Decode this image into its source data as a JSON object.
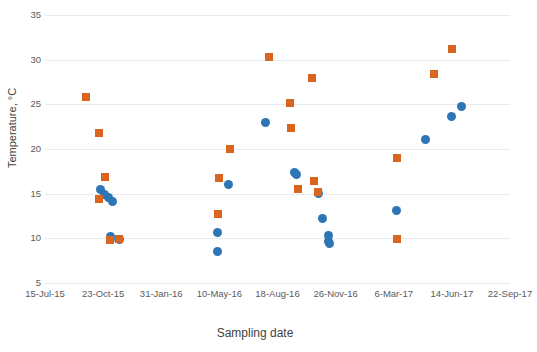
{
  "chart_data": {
    "type": "scatter",
    "title": "",
    "xlabel": "Sampling date",
    "ylabel": "Temperature, °C",
    "grid": true,
    "legend": "none",
    "ylim": [
      5,
      35
    ],
    "yticks": [
      5,
      10,
      15,
      20,
      25,
      30,
      35
    ],
    "xlim": [
      "15-Jul-15",
      "22-Sep-17"
    ],
    "xticks": [
      "15-Jul-15",
      "23-Oct-15",
      "31-Jan-16",
      "10-May-16",
      "18-Aug-16",
      "26-Nov-16",
      "6-Mar-17",
      "14-Jun-17",
      "22-Sep-17"
    ],
    "xtick_days": [
      0,
      100,
      200,
      300,
      400,
      500,
      600,
      700,
      800
    ],
    "colors": {
      "series_1": "#2e75b6",
      "series_2": "#d9661f",
      "grid": "#ebebeb",
      "tick_text": "#5a5a5a",
      "axis_title": "#3f3f3f",
      "background": "#ffffff"
    },
    "series": [
      {
        "name": "series_1",
        "marker": "circle",
        "color": "#2e75b6",
        "points": [
          {
            "x_days": 95,
            "y": 15.5
          },
          {
            "x_days": 102,
            "y": 14.9
          },
          {
            "x_days": 109,
            "y": 14.6
          },
          {
            "x_days": 116,
            "y": 14.1
          },
          {
            "x_days": 113,
            "y": 10.2
          },
          {
            "x_days": 113,
            "y": 9.9
          },
          {
            "x_days": 128,
            "y": 9.9
          },
          {
            "x_days": 297,
            "y": 8.5
          },
          {
            "x_days": 297,
            "y": 10.7
          },
          {
            "x_days": 315,
            "y": 16.0
          },
          {
            "x_days": 380,
            "y": 23.0
          },
          {
            "x_days": 430,
            "y": 17.4
          },
          {
            "x_days": 433,
            "y": 17.1
          },
          {
            "x_days": 470,
            "y": 15.0
          },
          {
            "x_days": 478,
            "y": 12.2
          },
          {
            "x_days": 487,
            "y": 10.3
          },
          {
            "x_days": 487,
            "y": 9.6
          },
          {
            "x_days": 490,
            "y": 9.4
          },
          {
            "x_days": 605,
            "y": 13.1
          },
          {
            "x_days": 655,
            "y": 21.1
          },
          {
            "x_days": 700,
            "y": 23.6
          },
          {
            "x_days": 717,
            "y": 24.8
          }
        ]
      },
      {
        "name": "series_2",
        "marker": "square",
        "color": "#d9661f",
        "points": [
          {
            "x_days": 70,
            "y": 25.8
          },
          {
            "x_days": 93,
            "y": 21.8
          },
          {
            "x_days": 93,
            "y": 14.4
          },
          {
            "x_days": 104,
            "y": 16.9
          },
          {
            "x_days": 112,
            "y": 9.8
          },
          {
            "x_days": 128,
            "y": 9.9
          },
          {
            "x_days": 297,
            "y": 12.7
          },
          {
            "x_days": 300,
            "y": 16.7
          },
          {
            "x_days": 318,
            "y": 20.0
          },
          {
            "x_days": 385,
            "y": 30.3
          },
          {
            "x_days": 422,
            "y": 25.1
          },
          {
            "x_days": 424,
            "y": 22.3
          },
          {
            "x_days": 435,
            "y": 15.5
          },
          {
            "x_days": 460,
            "y": 28.0
          },
          {
            "x_days": 462,
            "y": 16.4
          },
          {
            "x_days": 470,
            "y": 15.2
          },
          {
            "x_days": 605,
            "y": 19.0
          },
          {
            "x_days": 605,
            "y": 9.9
          },
          {
            "x_days": 670,
            "y": 28.4
          },
          {
            "x_days": 700,
            "y": 31.2
          }
        ]
      }
    ]
  }
}
